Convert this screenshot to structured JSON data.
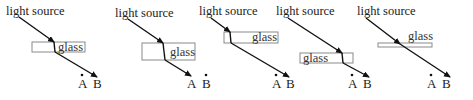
{
  "colors": {
    "ray": "#111111",
    "glass_border": "#8a8a8a",
    "text": "#222222",
    "background": "#ffffff"
  },
  "labels": {
    "source": "light source",
    "glass": "glass",
    "point_a": "A",
    "point_b": "B"
  },
  "panels": [
    {
      "id": 1,
      "source_text": {
        "x": 6,
        "y": 15
      },
      "glass": {
        "x": 32,
        "y": 42,
        "w": 53,
        "h": 10,
        "label_x": 58,
        "label_y": 51
      },
      "ray": [
        [
          19,
          17
        ],
        [
          54,
          42
        ],
        [
          55,
          52
        ],
        [
          97,
          77
        ]
      ],
      "arrows": [
        [
          54,
          42,
          "incident"
        ],
        [
          97,
          77,
          "exit"
        ]
      ],
      "point_a": {
        "x": 82,
        "label_y": 86
      },
      "point_b": {
        "x": 97,
        "label_y": 86
      },
      "dots": [
        "A"
      ]
    },
    {
      "id": 2,
      "source_text": {
        "x": 115,
        "y": 17
      },
      "glass": {
        "x": 142,
        "y": 43,
        "w": 53,
        "h": 17,
        "label_x": 170,
        "label_y": 56
      },
      "ray": [
        [
          128,
          19
        ],
        [
          163,
          43
        ],
        [
          165,
          60
        ],
        [
          191,
          76
        ]
      ],
      "arrows": [
        [
          163,
          43,
          "incident"
        ],
        [
          191,
          76,
          "exit"
        ]
      ],
      "point_a": {
        "x": 191,
        "label_y": 86
      },
      "point_b": {
        "x": 206,
        "label_y": 86
      },
      "dots": [
        "B"
      ]
    },
    {
      "id": 3,
      "source_text": {
        "x": 199,
        "y": 15
      },
      "glass": {
        "x": 224,
        "y": 32,
        "w": 54,
        "h": 11,
        "label_x": 252,
        "label_y": 41
      },
      "ray": [
        [
          211,
          18
        ],
        [
          230,
          32
        ],
        [
          231,
          43
        ],
        [
          289,
          77
        ]
      ],
      "arrows": [
        [
          230,
          32,
          "incident"
        ],
        [
          289,
          77,
          "exit"
        ]
      ],
      "point_a": {
        "x": 276,
        "label_y": 86
      },
      "point_b": {
        "x": 290,
        "label_y": 86
      },
      "dots": [
        "A"
      ]
    },
    {
      "id": 4,
      "source_text": {
        "x": 276,
        "y": 15
      },
      "glass": {
        "x": 300,
        "y": 53,
        "w": 53,
        "h": 10,
        "label_x": 303,
        "label_y": 62
      },
      "ray": [
        [
          288,
          18
        ],
        [
          342,
          53
        ],
        [
          343,
          63
        ],
        [
          369,
          77
        ]
      ],
      "arrows": [
        [
          342,
          53,
          "incident"
        ],
        [
          369,
          77,
          "exit"
        ]
      ],
      "point_a": {
        "x": 352,
        "label_y": 86
      },
      "point_b": {
        "x": 367,
        "label_y": 86
      },
      "dots": [
        "A"
      ]
    },
    {
      "id": 5,
      "source_text": {
        "x": 357,
        "y": 15
      },
      "glass": {
        "x": 378,
        "y": 43,
        "w": 54,
        "h": 4,
        "label_x": 408,
        "label_y": 40
      },
      "ray": [
        [
          366,
          18
        ],
        [
          400,
          44
        ],
        [
          450,
          77
        ]
      ],
      "arrows": [
        [
          400,
          44,
          "incident"
        ],
        [
          450,
          77,
          "exit"
        ]
      ],
      "point_a": {
        "x": 431,
        "label_y": 86
      },
      "point_b": {
        "x": 446,
        "label_y": 86
      },
      "dots": [
        "A",
        "B"
      ]
    }
  ]
}
